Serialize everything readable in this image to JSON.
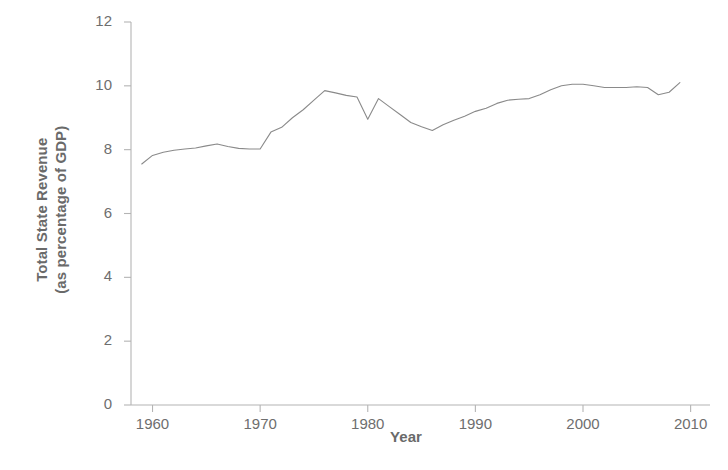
{
  "chart_data": {
    "type": "line",
    "title": "",
    "xlabel": "Year",
    "ylabel": "Total State Revenue (as percentage of GDP)",
    "ylabel_line1": "Total State Revenue",
    "ylabel_line2": "(as percentage of GDP)",
    "xlim": [
      1958,
      2010.5
    ],
    "ylim": [
      0,
      12
    ],
    "grid": false,
    "legend": null,
    "line_color": "#8a8a8a",
    "axis_color": "#b4b4b4",
    "text_color": "#6e6e6e",
    "y_ticks": [
      0,
      2,
      4,
      6,
      8,
      10,
      12
    ],
    "y_tick_labels": [
      "0",
      "2",
      "4",
      "6",
      "8",
      "10",
      "12"
    ],
    "x_ticks": [
      1960,
      1970,
      1980,
      1990,
      2000,
      2010
    ],
    "x_tick_labels": [
      "1960",
      "1970",
      "1980",
      "1990",
      "2000",
      "2010"
    ],
    "series": [
      {
        "name": "Total State Revenue",
        "x": [
          1959,
          1960,
          1961,
          1962,
          1963,
          1964,
          1965,
          1966,
          1967,
          1968,
          1969,
          1970,
          1971,
          1972,
          1973,
          1974,
          1975,
          1976,
          1977,
          1978,
          1979,
          1980,
          1981,
          1982,
          1983,
          1984,
          1985,
          1986,
          1987,
          1988,
          1989,
          1990,
          1991,
          1992,
          1993,
          1994,
          1995,
          1996,
          1997,
          1998,
          1999,
          2000,
          2001,
          2002,
          2003,
          2004,
          2005,
          2006,
          2007,
          2008,
          2009
        ],
        "y": [
          7.55,
          7.82,
          7.92,
          7.98,
          8.02,
          8.05,
          8.12,
          8.18,
          8.1,
          8.04,
          8.02,
          8.02,
          8.55,
          8.7,
          9.0,
          9.25,
          9.55,
          9.85,
          9.78,
          9.7,
          9.65,
          8.95,
          9.6,
          9.35,
          9.1,
          8.85,
          8.72,
          8.6,
          8.78,
          8.92,
          9.05,
          9.2,
          9.3,
          9.45,
          9.55,
          9.58,
          9.6,
          9.72,
          9.88,
          10.0,
          10.05,
          10.05,
          10.0,
          9.95,
          9.95,
          9.95,
          9.97,
          9.95,
          9.72,
          9.8,
          10.1
        ]
      }
    ]
  }
}
